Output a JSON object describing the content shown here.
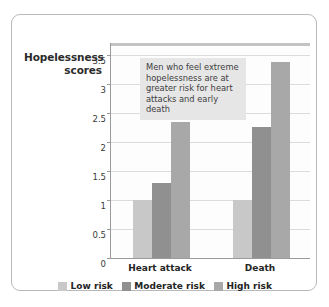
{
  "chart_data": {
    "type": "bar",
    "title": "",
    "xlabel": "",
    "ylabel": "Hopelessness scores",
    "categories": [
      "Heart attack",
      "Death"
    ],
    "series": [
      {
        "name": "Low risk",
        "color": "#c8c8c8",
        "values": [
          1.0,
          1.0
        ]
      },
      {
        "name": "Moderate risk",
        "color": "#909090",
        "values": [
          1.3,
          2.25
        ]
      },
      {
        "name": "High risk",
        "color": "#a8a8a8",
        "values": [
          2.35,
          3.38
        ]
      }
    ],
    "ylim": [
      0,
      3.72
    ],
    "yticks": [
      "0",
      "0.5",
      "1",
      "1.5",
      "2",
      "2.5",
      "3",
      "3.5"
    ],
    "ytick_values": [
      0,
      0.5,
      1,
      1.5,
      2,
      2.5,
      3,
      3.5
    ],
    "grid": true,
    "legend_position": "bottom",
    "annotation": "Men who feel extreme hopelessness are at greater risk for heart attacks and early death"
  }
}
